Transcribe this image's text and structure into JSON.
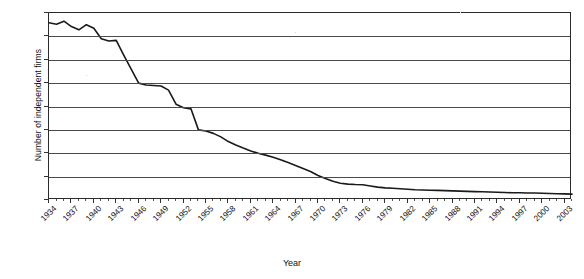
{
  "chart_data": {
    "type": "line",
    "title": "",
    "xlabel": "Year",
    "ylabel": "Number of independent firms",
    "ylim": [
      0,
      800
    ],
    "ytick_step": 100,
    "yticks": [
      0,
      100,
      200,
      300,
      400,
      500,
      600,
      700,
      800
    ],
    "xlim": [
      1934,
      2004
    ],
    "xticks": [
      1934,
      1937,
      1940,
      1943,
      1946,
      1949,
      1952,
      1955,
      1958,
      1961,
      1964,
      1967,
      1970,
      1973,
      1976,
      1979,
      1982,
      1985,
      1988,
      1991,
      1994,
      1997,
      2000,
      2003
    ],
    "xtick_labels": [
      "1934",
      "1937",
      "1940",
      "1943",
      "1946",
      "1949",
      "1952",
      "1955",
      "1958",
      "1961",
      "1964",
      "1967",
      "1970",
      "1973",
      "1976",
      "1979",
      "1982",
      "1985",
      "1988",
      "1991",
      "1994",
      "1997",
      "2000",
      "2003"
    ],
    "grid": "horizontal",
    "legend": "none",
    "line_color": "#1a1a1a",
    "series": [
      {
        "name": "Number of independent firms",
        "x": [
          1934,
          1935,
          1936,
          1937,
          1938,
          1939,
          1940,
          1941,
          1942,
          1943,
          1944,
          1945,
          1946,
          1947,
          1948,
          1949,
          1950,
          1951,
          1952,
          1953,
          1954,
          1955,
          1956,
          1957,
          1958,
          1959,
          1960,
          1961,
          1962,
          1963,
          1964,
          1965,
          1966,
          1967,
          1968,
          1969,
          1970,
          1971,
          1972,
          1973,
          1974,
          1975,
          1976,
          1977,
          1978,
          1979,
          1980,
          1981,
          1982,
          1983,
          1984,
          1985,
          1986,
          1987,
          1988,
          1989,
          1990,
          1991,
          1992,
          1993,
          1994,
          1995,
          1996,
          1997,
          1998,
          1999,
          2000,
          2001,
          2002,
          2003,
          2004
        ],
        "values": [
          758,
          752,
          765,
          742,
          728,
          750,
          735,
          690,
          680,
          683,
          620,
          560,
          500,
          492,
          490,
          488,
          470,
          410,
          395,
          390,
          300,
          295,
          285,
          270,
          250,
          235,
          222,
          210,
          200,
          192,
          183,
          172,
          160,
          148,
          135,
          122,
          105,
          92,
          80,
          72,
          68,
          66,
          65,
          60,
          55,
          52,
          50,
          48,
          46,
          44,
          43,
          42,
          41,
          40,
          39,
          38,
          37,
          36,
          35,
          34,
          33,
          32,
          31,
          31,
          30,
          30,
          29,
          28,
          27,
          26,
          25
        ]
      }
    ]
  },
  "axes": {
    "y_title": "Number of independent firms",
    "x_title": "Year"
  }
}
